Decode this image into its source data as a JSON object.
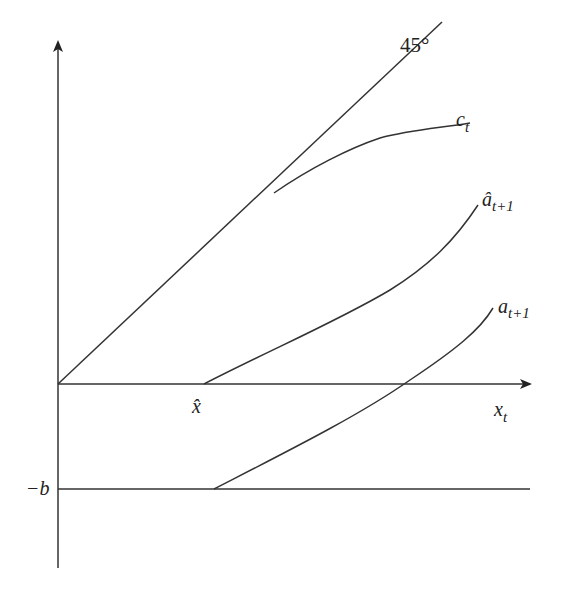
{
  "diagram": {
    "type": "economics-consumption-savings-diagram",
    "axes": {
      "x_label": {
        "base": "x",
        "sub": "t"
      },
      "y_axis_arrow": true,
      "x_axis_arrow": true
    },
    "reference_line": {
      "label": "45°"
    },
    "curves": [
      {
        "id": "consumption",
        "label_base": "c",
        "label_sub": "t"
      },
      {
        "id": "a-hat-next",
        "label_base": "â",
        "label_sub": "t+1"
      },
      {
        "id": "a-next",
        "label_base": "a",
        "label_sub": "t+1"
      }
    ],
    "tick_labels": {
      "x_hat": "x̂",
      "neg_b": "−b"
    }
  }
}
